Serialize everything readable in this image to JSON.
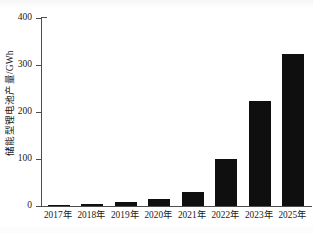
{
  "chart_data": {
    "type": "bar",
    "title": "",
    "xlabel": "",
    "ylabel": "储能型锂电池产量/GWh",
    "categories": [
      "2017年",
      "2018年",
      "2019年",
      "2020年",
      "2021年",
      "2022年",
      "2023年",
      "2025年"
    ],
    "values": [
      3,
      5,
      8,
      14,
      30,
      101,
      224,
      323
    ],
    "ylim": [
      0,
      400
    ],
    "yticks": [
      0,
      100,
      200,
      300,
      400
    ],
    "ytick_labels": [
      "0",
      "100",
      "200",
      "300",
      "400"
    ],
    "grid": false,
    "legend": null,
    "bar_color": "#100f0f",
    "axis_color": "#4d4d4d"
  }
}
